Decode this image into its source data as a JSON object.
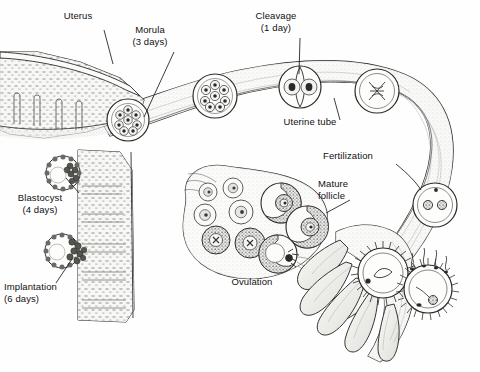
{
  "figure": {
    "type": "anatomical-illustration",
    "background_color": "#fefefe",
    "ink_color": "#111111",
    "tissue_fill": "#f4f4f2",
    "shading_color": "#9a9a9a"
  },
  "labels": [
    {
      "id": "uterus",
      "text": "Uterus",
      "x": 78,
      "y": 14,
      "align": "center",
      "leader": [
        [
          104,
          30
        ],
        [
          113,
          64
        ]
      ]
    },
    {
      "id": "morula",
      "text": "Morula\n(3 days)",
      "x": 150,
      "y": 28,
      "align": "center",
      "leader": [
        [
          174,
          52
        ],
        [
          144,
          117
        ]
      ]
    },
    {
      "id": "cleavage",
      "text": "Cleavage\n(1 day)",
      "x": 276,
      "y": 14,
      "align": "center",
      "leader": [
        [
          300,
          38
        ],
        [
          299,
          74
        ]
      ]
    },
    {
      "id": "uterine-tube",
      "text": "Uterine tube",
      "x": 310,
      "y": 121,
      "align": "center",
      "leader": [
        [
          340,
          120
        ],
        [
          334,
          98
        ]
      ]
    },
    {
      "id": "fertilization",
      "text": "Fertilization",
      "x": 348,
      "y": 155,
      "align": "center",
      "leader": [
        [
          396,
          164
        ],
        [
          421,
          190
        ]
      ]
    },
    {
      "id": "mature-follicle",
      "text": "Mature\nfollicle",
      "x": 318,
      "y": 183,
      "align": "left",
      "leader": [
        [
          350,
          200
        ],
        [
          326,
          213
        ]
      ]
    },
    {
      "id": "ovulation",
      "text": "Ovulation",
      "x": 252,
      "y": 281,
      "align": "center",
      "leader": []
    },
    {
      "id": "blastocyst",
      "text": "Blastocyst\n(4 days)",
      "x": 26,
      "y": 196,
      "align": "center",
      "leader": [
        [
          79,
          193
        ],
        [
          66,
          178
        ]
      ]
    },
    {
      "id": "implantation",
      "text": "Implantation\n(6 days)",
      "x": 6,
      "y": 285,
      "align": "left",
      "leader": [
        [
          56,
          283
        ],
        [
          72,
          259
        ]
      ]
    }
  ],
  "structures": [
    {
      "id": "uterus-wall",
      "name": "Uterus wall with endometrium"
    },
    {
      "id": "uterine-tube",
      "name": "Uterine tube (fallopian tube)"
    },
    {
      "id": "ovary",
      "name": "Ovary with developing follicles"
    },
    {
      "id": "infundibulum",
      "name": "Infundibulum with fimbriae"
    }
  ],
  "stages": [
    {
      "id": "ovulated-oocyte",
      "name": "Ovulated oocyte in fimbriae",
      "cx": 383,
      "cy": 273,
      "r": 25
    },
    {
      "id": "fertilization-oocyte",
      "name": "Oocyte with sperm",
      "cx": 428,
      "cy": 289,
      "r": 24
    },
    {
      "id": "zygote-pronuclei",
      "name": "Zygote with pronuclei",
      "cx": 435,
      "cy": 205,
      "r": 22
    },
    {
      "id": "dividing-zygote",
      "name": "Dividing zygote",
      "cx": 377,
      "cy": 91,
      "r": 22
    },
    {
      "id": "two-cell",
      "name": "Two-cell stage",
      "cx": 300,
      "cy": 87,
      "r": 21
    },
    {
      "id": "morula-right",
      "name": "Morula",
      "cx": 215,
      "cy": 96,
      "r": 22
    },
    {
      "id": "morula-left",
      "name": "Morula",
      "cx": 128,
      "cy": 120,
      "r": 21
    },
    {
      "id": "blastocyst-upper",
      "name": "Blastocyst",
      "cx": 63,
      "cy": 173,
      "r": 17
    },
    {
      "id": "blastocyst-implanting",
      "name": "Implanting blastocyst",
      "cx": 62,
      "cy": 251,
      "r": 17
    }
  ],
  "follicles": [
    {
      "id": "primordial-1",
      "cx": 208,
      "cy": 192,
      "r": 9,
      "stage": "primordial"
    },
    {
      "id": "primordial-2",
      "cx": 233,
      "cy": 188,
      "r": 10,
      "stage": "primordial"
    },
    {
      "id": "primary-1",
      "cx": 205,
      "cy": 215,
      "r": 11,
      "stage": "primary"
    },
    {
      "id": "primary-2",
      "cx": 241,
      "cy": 212,
      "r": 12,
      "stage": "primary"
    },
    {
      "id": "secondary-1",
      "cx": 216,
      "cy": 240,
      "r": 14,
      "stage": "secondary"
    },
    {
      "id": "secondary-2",
      "cx": 250,
      "cy": 243,
      "r": 15,
      "stage": "secondary"
    },
    {
      "id": "mature-1",
      "cx": 281,
      "cy": 203,
      "r": 20,
      "stage": "mature"
    },
    {
      "id": "mature-2",
      "cx": 307,
      "cy": 227,
      "r": 21,
      "stage": "mature"
    },
    {
      "id": "ovulating",
      "cx": 278,
      "cy": 254,
      "r": 19,
      "stage": "ovulating"
    }
  ]
}
